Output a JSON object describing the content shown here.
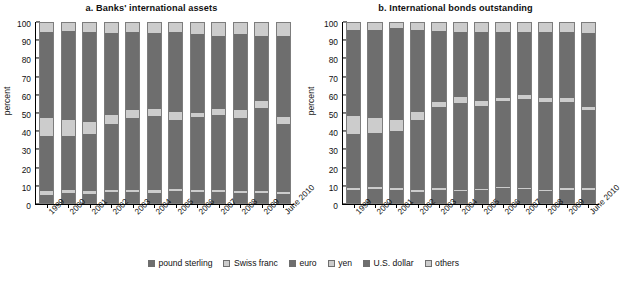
{
  "figure": {
    "ylabel": "percent",
    "yticks": [
      0,
      10,
      20,
      30,
      40,
      50,
      60,
      70,
      80,
      90,
      100
    ],
    "categories": [
      "1999",
      "2000",
      "2001",
      "2002",
      "2003",
      "2004",
      "2005",
      "2006",
      "2007",
      "2008",
      "2009",
      "June 2010"
    ],
    "series_names": [
      "pound sterling",
      "Swiss franc",
      "euro",
      "yen",
      "U.S. dollar",
      "others"
    ],
    "colors": {
      "pound_sterling": "#6e6e6e",
      "swiss_franc": "#cccccc",
      "euro": "#6e6e6e",
      "yen": "#cccccc",
      "us_dollar": "#6e6e6e",
      "others": "#cccccc",
      "axis": "#000000",
      "background": "#ffffff"
    }
  },
  "legend": {
    "items": [
      {
        "label": "pound sterling",
        "color": "#6e6e6e",
        "swatch": "legend-swatch-pound-sterling"
      },
      {
        "label": "Swiss franc",
        "color": "#cccccc",
        "swatch": "legend-swatch-swiss-franc"
      },
      {
        "label": "euro",
        "color": "#6e6e6e",
        "swatch": "legend-swatch-euro"
      },
      {
        "label": "yen",
        "color": "#cccccc",
        "swatch": "legend-swatch-yen"
      },
      {
        "label": "U.S. dollar",
        "color": "#6e6e6e",
        "swatch": "legend-swatch-us-dollar"
      },
      {
        "label": "others",
        "color": "#cccccc",
        "swatch": "legend-swatch-others"
      }
    ]
  },
  "chart_data": [
    {
      "id": "panel-a",
      "type": "bar",
      "subtype": "stacked-bar-100",
      "title": "a. Banks' international assets",
      "xlabel": "",
      "ylabel": "percent",
      "ylim": [
        0,
        100
      ],
      "ytick_step": 10,
      "grid": false,
      "legend_position": "bottom-shared",
      "categories": [
        "1999",
        "2000",
        "2001",
        "2002",
        "2003",
        "2004",
        "2005",
        "2006",
        "2007",
        "2008",
        "2009",
        "June 2010"
      ],
      "series": [
        {
          "name": "pound sterling",
          "color": "#6e6e6e",
          "values": [
            4.5,
            5.5,
            5.0,
            6.2,
            6.0,
            5.7,
            6.8,
            6.0,
            6.2,
            5.3,
            5.3,
            5.2
          ]
        },
        {
          "name": "Swiss franc",
          "color": "#cccccc",
          "values": [
            2.0,
            2.0,
            1.8,
            1.3,
            1.2,
            1.3,
            1.2,
            1.2,
            1.3,
            1.2,
            1.2,
            1.0
          ]
        },
        {
          "name": "euro",
          "color": "#6e6e6e",
          "values": [
            31.0,
            30.0,
            31.7,
            36.2,
            39.8,
            41.5,
            38.0,
            40.6,
            41.5,
            40.7,
            46.5,
            37.8
          ]
        },
        {
          "name": "yen",
          "color": "#cccccc",
          "values": [
            9.5,
            8.5,
            6.5,
            5.0,
            4.5,
            3.8,
            4.3,
            2.2,
            3.0,
            4.3,
            3.5,
            4.0
          ]
        },
        {
          "name": "U.S. dollar",
          "color": "#6e6e6e",
          "values": [
            48.0,
            49.5,
            50.0,
            45.8,
            43.5,
            42.2,
            44.7,
            44.0,
            41.0,
            42.5,
            36.5,
            45.0
          ]
        },
        {
          "name": "others",
          "color": "#cccccc",
          "values": [
            5.0,
            4.5,
            5.0,
            5.5,
            5.0,
            5.5,
            5.0,
            6.0,
            7.0,
            6.0,
            7.0,
            7.0
          ]
        }
      ]
    },
    {
      "id": "panel-b",
      "type": "bar",
      "subtype": "stacked-bar-100",
      "title": "b. International bonds outstanding",
      "xlabel": "",
      "ylabel": "percent",
      "ylim": [
        0,
        100
      ],
      "ytick_step": 10,
      "grid": false,
      "legend_position": "bottom-shared",
      "categories": [
        "1999",
        "2000",
        "2001",
        "2002",
        "2003",
        "2004",
        "2005",
        "2006",
        "2007",
        "2008",
        "2009",
        "June 2010"
      ],
      "series": [
        {
          "name": "pound sterling",
          "color": "#6e6e6e",
          "values": [
            7.0,
            7.8,
            7.5,
            6.3,
            7.3,
            6.5,
            7.0,
            8.2,
            7.8,
            6.5,
            7.3,
            7.5
          ]
        },
        {
          "name": "Swiss franc",
          "color": "#cccccc",
          "values": [
            1.3,
            1.2,
            1.0,
            0.8,
            0.8,
            0.8,
            0.8,
            0.8,
            0.7,
            0.8,
            0.8,
            0.8
          ]
        },
        {
          "name": "euro",
          "color": "#6e6e6e",
          "values": [
            30.2,
            30.0,
            31.5,
            39.0,
            45.0,
            48.5,
            46.0,
            47.5,
            49.2,
            48.8,
            48.3,
            43.5
          ]
        },
        {
          "name": "yen",
          "color": "#cccccc",
          "values": [
            10.0,
            8.0,
            6.0,
            4.5,
            3.0,
            3.0,
            3.0,
            2.0,
            2.3,
            2.2,
            1.9,
            1.5
          ]
        },
        {
          "name": "U.S. dollar",
          "color": "#6e6e6e",
          "values": [
            47.5,
            49.0,
            51.5,
            45.4,
            39.4,
            36.2,
            38.2,
            36.5,
            35.0,
            36.7,
            36.7,
            41.2
          ]
        },
        {
          "name": "others",
          "color": "#cccccc",
          "values": [
            4.0,
            4.0,
            2.5,
            4.0,
            4.5,
            5.0,
            5.0,
            5.0,
            5.0,
            5.0,
            5.0,
            5.5
          ]
        }
      ]
    }
  ]
}
